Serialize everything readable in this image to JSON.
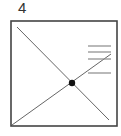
{
  "figure": {
    "label": "4",
    "colors": {
      "frame": "#444444",
      "line": "#666666",
      "rule": "#8a8a8a",
      "dot": "#111111",
      "background": "#ffffff"
    },
    "frame": {
      "x": 11,
      "y": 21,
      "width": 106,
      "height": 105
    },
    "diagonals": [
      {
        "name": "top-left-to-bottom-right",
        "x1": 17,
        "y1": 27,
        "x2": 109,
        "y2": 120
      },
      {
        "name": "bottom-left-to-upper-right",
        "x1": 12,
        "y1": 125,
        "x2": 111,
        "y2": 54
      }
    ],
    "intersection_dot": {
      "cx": 72,
      "cy": 83,
      "r": 3.2
    },
    "horizontal_rules": [
      {
        "x1": 88,
        "x2": 111,
        "y": 46
      },
      {
        "x1": 88,
        "x2": 111,
        "y": 52
      },
      {
        "x1": 88,
        "x2": 111,
        "y": 59
      },
      {
        "x1": 88,
        "x2": 111,
        "y": 73
      }
    ]
  }
}
